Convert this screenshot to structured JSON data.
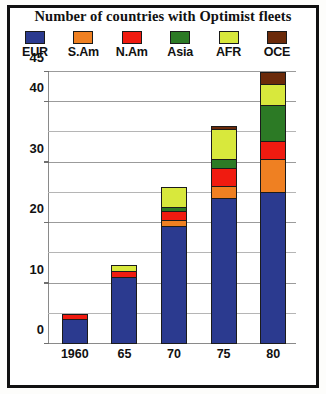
{
  "figure": {
    "title": "Number of countries with Optimist fleets",
    "frame_color": "#111111",
    "background": "#ffffff"
  },
  "legend": {
    "position": "top",
    "entries": [
      {
        "label": "EUR",
        "color": "#2b3a8f"
      },
      {
        "label": "S.Am",
        "color": "#ef8022"
      },
      {
        "label": "N.Am",
        "color": "#f01b10"
      },
      {
        "label": "Asia",
        "color": "#2c7a25"
      },
      {
        "label": "AFR",
        "color": "#d8e83c"
      },
      {
        "label": "OCE",
        "color": "#6b2a0a"
      }
    ]
  },
  "axes": {
    "y_ticks": [
      0,
      10,
      20,
      30,
      40,
      45
    ],
    "y_tick_labels": [
      "0",
      "10",
      "20",
      "30",
      "40",
      "45"
    ],
    "y_gridlines": [
      5,
      10,
      15,
      20,
      25,
      30,
      35,
      40,
      45
    ],
    "ylim": [
      0,
      45
    ],
    "x_tick_labels": [
      "1960",
      "65",
      "70",
      "75",
      "80"
    ],
    "grid": "horizontal"
  },
  "chart_data": {
    "type": "bar",
    "subtype": "stacked",
    "title": "Number of countries with Optimist fleets",
    "xlabel": "",
    "ylabel": "",
    "ylim": [
      0,
      45
    ],
    "grid": true,
    "legend_position": "top",
    "categories": [
      "1960",
      "65",
      "70",
      "75",
      "80"
    ],
    "series": [
      {
        "name": "EUR",
        "color": "#2b3a8f",
        "values": [
          4,
          11,
          19.5,
          24,
          25
        ]
      },
      {
        "name": "S.Am",
        "color": "#ef8022",
        "values": [
          0,
          0,
          1,
          2,
          5.5
        ]
      },
      {
        "name": "N.Am",
        "color": "#f01b10",
        "values": [
          1,
          1,
          1.5,
          3,
          3
        ]
      },
      {
        "name": "Asia",
        "color": "#2c7a25",
        "values": [
          0,
          0,
          0.7,
          1.5,
          6
        ]
      },
      {
        "name": "AFR",
        "color": "#d8e83c",
        "values": [
          0,
          1,
          3.3,
          5,
          3.5
        ]
      },
      {
        "name": "OCE",
        "color": "#6b2a0a",
        "values": [
          0,
          0,
          0,
          0.5,
          2
        ]
      }
    ],
    "totals": [
      5,
      13,
      26,
      36,
      45
    ]
  }
}
